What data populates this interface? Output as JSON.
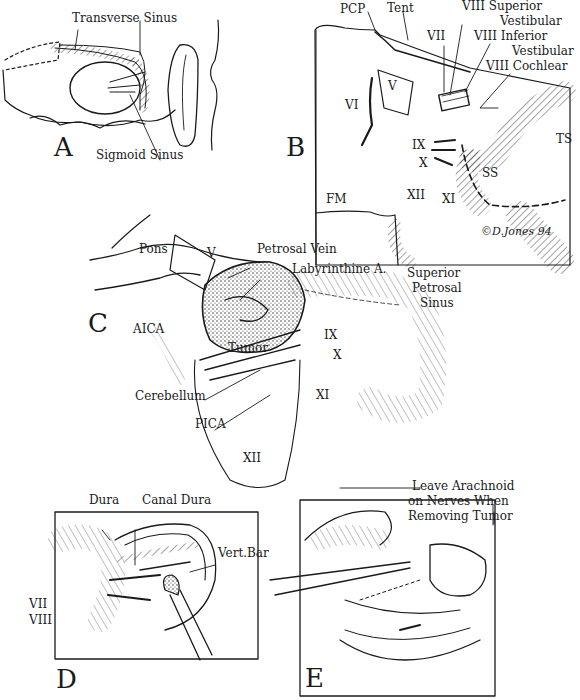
{
  "figure": {
    "panels": [
      {
        "id": "A",
        "letter": "A",
        "labels": {
          "transverse_sinus": "Transverse Sinus",
          "sigmoid_sinus": "Sigmoid Sinus"
        }
      },
      {
        "id": "B",
        "letter": "B",
        "labels": {
          "pcp": "PCP",
          "tent": "Tent",
          "viii_superior_1": "VIII Superior",
          "viii_superior_2": "Vestibular",
          "vii": "VII",
          "viii_inferior_1": "VIII Inferior",
          "viii_inferior_2": "Vestibular",
          "viii_cochlear": "VIII Cochlear",
          "v": "V",
          "vi": "VI",
          "ts": "TS",
          "ix": "IX",
          "x": "X",
          "ss": "SS",
          "fm": "FM",
          "xii": "XII",
          "xi": "XI"
        },
        "signature": "©D.Jones 94"
      },
      {
        "id": "C",
        "letter": "C",
        "labels": {
          "pons": "Pons",
          "v": "V",
          "petrosal_vein": "Petrosal Vein",
          "labyrinthine_a": "Labyrinthine A.",
          "superior_petrosal_1": "Superior",
          "superior_petrosal_2": "Petrosal",
          "superior_petrosal_3": "Sinus",
          "aica": "AICA",
          "tumor": "Tumor",
          "ix": "IX",
          "x": "X",
          "xi": "XI",
          "cerebellum": "Cerebellum",
          "pica": "PICA",
          "xii": "XII"
        }
      },
      {
        "id": "D",
        "letter": "D",
        "labels": {
          "dura": "Dura",
          "canal_dura": "Canal Dura",
          "vert_bar": "Vert.Bar",
          "vii": "VII",
          "viii": "VIII"
        }
      },
      {
        "id": "E",
        "letter": "E",
        "labels": {
          "note_1": "Leave Arachnoid",
          "note_2": "on Nerves When",
          "note_3": "Removing Tumor"
        }
      }
    ],
    "colors": {
      "ink": "#1a1a1a",
      "paper": "#ffffff"
    }
  }
}
